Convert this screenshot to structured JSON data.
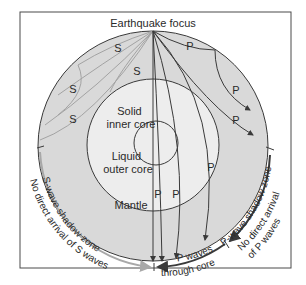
{
  "title": "Earthquake focus",
  "layers": {
    "inner_core": [
      "Solid",
      "inner core"
    ],
    "outer_core": [
      "Liquid",
      "outer core"
    ],
    "mantle": "Mantle"
  },
  "wave_labels": {
    "s": "S",
    "p": "P"
  },
  "zones": {
    "s_shadow": "S-wave shadow zone",
    "s_no_arrival": "No direct arrival of S waves",
    "p_through_core_1": "P waves",
    "p_through_core_2": "through core",
    "p_shadow": "P-wave shadow zone",
    "p_no_arrival_1": "No direct arrival",
    "p_no_arrival_2": "of P waves"
  },
  "colors": {
    "mantle_fill": "#d9d9d9",
    "core_fill": "#ededed",
    "line": "#3a3a3a",
    "s_arrow": "#a8a8a8",
    "p_arrow": "#3a3a3a",
    "frame": "#4a4a4a"
  }
}
